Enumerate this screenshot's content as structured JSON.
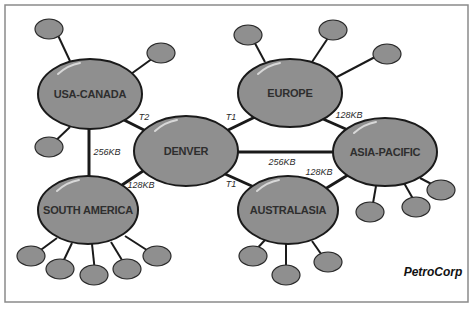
{
  "diagram": {
    "title": "PetroCorp",
    "hubs": [
      {
        "id": "usa-canada",
        "label": "USA-CANADA",
        "cx": 90,
        "cy": 94,
        "rx": 52,
        "ry": 35
      },
      {
        "id": "europe",
        "label": "EUROPE",
        "cx": 290,
        "cy": 93,
        "rx": 52,
        "ry": 34
      },
      {
        "id": "denver",
        "label": "DENVER",
        "cx": 186,
        "cy": 151,
        "rx": 52,
        "ry": 35
      },
      {
        "id": "asia-pacific",
        "label": "ASIA-PACIFIC",
        "cx": 385,
        "cy": 152,
        "rx": 52,
        "ry": 34
      },
      {
        "id": "south-america",
        "label": "SOUTH AMERICA",
        "cx": 88,
        "cy": 210,
        "rx": 50,
        "ry": 34
      },
      {
        "id": "australasia",
        "label": "AUSTRALASIA",
        "cx": 288,
        "cy": 210,
        "rx": 50,
        "ry": 34
      }
    ],
    "links": [
      {
        "from": "usa-canada",
        "to": "denver",
        "label": "T2"
      },
      {
        "from": "europe",
        "to": "denver",
        "label": "T1"
      },
      {
        "from": "usa-canada",
        "to": "south-america",
        "label": "256KB"
      },
      {
        "from": "denver",
        "to": "south-america",
        "label": "128KB"
      },
      {
        "from": "denver",
        "to": "asia-pacific",
        "label": "256KB"
      },
      {
        "from": "denver",
        "to": "australasia",
        "label": "T1"
      },
      {
        "from": "europe",
        "to": "asia-pacific",
        "label": "128KB"
      },
      {
        "from": "australasia",
        "to": "asia-pacific",
        "label": "128KB"
      }
    ],
    "leaf_counts": {
      "usa-canada": 3,
      "europe": 3,
      "asia-pacific": 3,
      "south-america": 5,
      "australasia": 3
    }
  }
}
